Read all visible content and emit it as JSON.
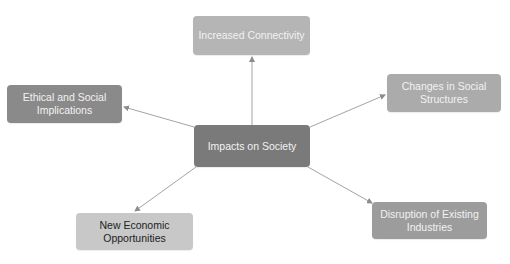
{
  "diagram": {
    "type": "mind-map",
    "center": {
      "label": "Impacts on Society",
      "color": "#7a7a7a"
    },
    "nodes": [
      {
        "id": "top",
        "label": "Increased Connectivity",
        "color": "#b5b5b5"
      },
      {
        "id": "left",
        "label": "Ethical and Social Implications",
        "color": "#8a8a8a"
      },
      {
        "id": "right",
        "label": "Changes in Social Structures",
        "color": "#ababab"
      },
      {
        "id": "bottom_left",
        "label": "New Economic Opportunities",
        "color": "#c8c8c8"
      },
      {
        "id": "bottom_right",
        "label": "Disruption of Existing Industries",
        "color": "#9c9c9c"
      }
    ],
    "edges": [
      {
        "from": "Impacts on Society",
        "to": "Increased Connectivity"
      },
      {
        "from": "Impacts on Society",
        "to": "Ethical and Social Implications"
      },
      {
        "from": "Impacts on Society",
        "to": "Changes in Social Structures"
      },
      {
        "from": "Impacts on Society",
        "to": "New Economic Opportunities"
      },
      {
        "from": "Impacts on Society",
        "to": "Disruption of Existing Industries"
      }
    ],
    "edge_color": "#8c8c8c"
  }
}
